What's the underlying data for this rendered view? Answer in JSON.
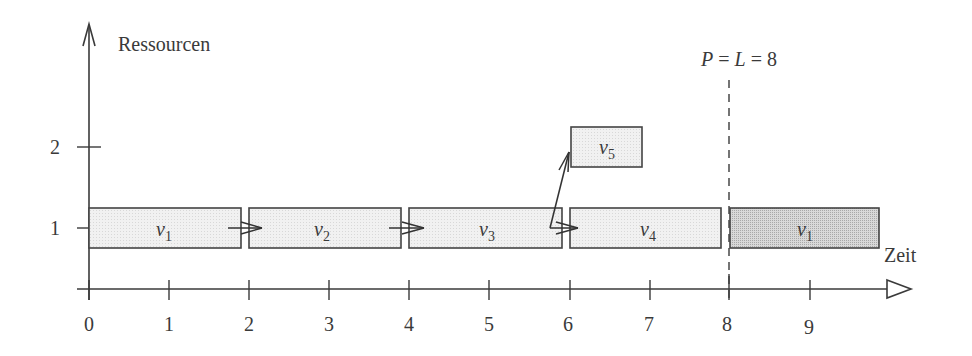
{
  "diagram": {
    "y_axis_label": "Ressourcen",
    "x_axis_label": "Zeit",
    "y_ticks": [
      {
        "value": 1,
        "label": "1"
      },
      {
        "value": 2,
        "label": "2"
      }
    ],
    "x_ticks": [
      "0",
      "1",
      "2",
      "3",
      "4",
      "5",
      "6",
      "7",
      "8",
      "9"
    ],
    "period_marker": {
      "label": "P = L = 8",
      "at": 8,
      "style": "dashed"
    },
    "tasks": [
      {
        "name": "v",
        "sub": "1",
        "start": 0,
        "end": 1.9,
        "resource": 1,
        "shade": "light"
      },
      {
        "name": "v",
        "sub": "2",
        "start": 2,
        "end": 3.9,
        "resource": 1,
        "shade": "light"
      },
      {
        "name": "v",
        "sub": "3",
        "start": 4,
        "end": 5.9,
        "resource": 1,
        "shade": "light"
      },
      {
        "name": "v",
        "sub": "4",
        "start": 6,
        "end": 7.9,
        "resource": 1,
        "shade": "light"
      },
      {
        "name": "v",
        "sub": "5",
        "start": 6,
        "end": 6.9,
        "resource": 2,
        "shade": "light"
      },
      {
        "name": "v",
        "sub": "1",
        "start": 8,
        "end": 9.9,
        "resource": 1,
        "shade": "dark"
      }
    ],
    "dependencies": [
      {
        "from": "v1",
        "to": "v2"
      },
      {
        "from": "v2",
        "to": "v3"
      },
      {
        "from": "v3",
        "to": "v4"
      },
      {
        "from": "v3",
        "to": "v5"
      }
    ],
    "colors": {
      "axis": "#3a3a3a",
      "box_light": "#eeeeee",
      "box_dark": "#d2d2d2",
      "box_border": "#444444"
    }
  }
}
